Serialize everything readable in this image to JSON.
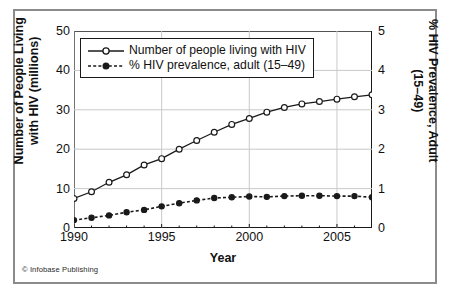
{
  "credit": "© Infobase Publishing",
  "legend": {
    "position": "top-left-inside",
    "entries": [
      {
        "label": "Number of people living with HIV",
        "marker": "open-circle",
        "line": "solid"
      },
      {
        "label": "% HIV prevalence, adult (15–49)",
        "marker": "filled-circle",
        "line": "dashed"
      }
    ]
  },
  "colors": {
    "line": "#1a1a1a",
    "grid": "#c9c9c9",
    "frame": "#8b8b8b",
    "axis": "#1a1a1a",
    "background": "#ffffff"
  },
  "chart_data": {
    "type": "line",
    "title": "",
    "xlabel": "Year",
    "ylabel": "Number of People Living with HIV (millions)",
    "ylabel_right": "% HIV Prevalence, Adult (15–49)",
    "xlim": [
      1990,
      2007
    ],
    "ylim": [
      0,
      50
    ],
    "ylim_right": [
      0,
      5
    ],
    "yticks": [
      0,
      10,
      20,
      30,
      40,
      50
    ],
    "yticks_right": [
      0,
      1,
      2,
      3,
      4,
      5
    ],
    "xticks": [
      1990,
      1995,
      2000,
      2005
    ],
    "xticks_all": [
      1990,
      1991,
      1992,
      1993,
      1994,
      1995,
      1996,
      1997,
      1998,
      1999,
      2000,
      2001,
      2002,
      2003,
      2004,
      2005,
      2006,
      2007
    ],
    "grid": true,
    "x": [
      1990,
      1991,
      1992,
      1993,
      1994,
      1995,
      1996,
      1997,
      1998,
      1999,
      2000,
      2001,
      2002,
      2003,
      2004,
      2005,
      2006,
      2007
    ],
    "series": [
      {
        "name": "Number of people living with HIV",
        "axis": "left",
        "units": "millions",
        "values": [
          7.5,
          9.2,
          11.6,
          13.5,
          16.0,
          17.6,
          20.0,
          22.2,
          24.3,
          26.3,
          27.8,
          29.4,
          30.6,
          31.5,
          32.1,
          32.7,
          33.3,
          33.8
        ]
      },
      {
        "name": "% HIV prevalence, adult (15–49)",
        "axis": "right",
        "units": "percent",
        "values": [
          0.2,
          0.26,
          0.32,
          0.4,
          0.46,
          0.55,
          0.63,
          0.7,
          0.76,
          0.78,
          0.8,
          0.79,
          0.81,
          0.82,
          0.82,
          0.81,
          0.81,
          0.78
        ]
      }
    ]
  }
}
